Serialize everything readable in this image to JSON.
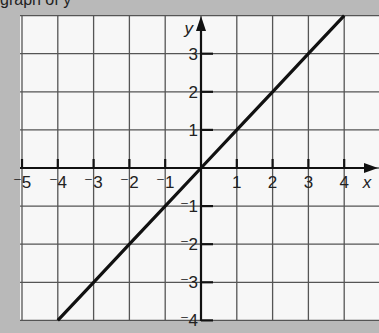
{
  "caption": "graph of y",
  "colors": {
    "page_background": "#b9b9b9",
    "grid_background": "#f7f7f7",
    "grid_line": "#555555",
    "axis": "#111111",
    "plot_line": "#111111"
  },
  "axes": {
    "x_label": "x",
    "y_label": "y",
    "x_ticks": [
      {
        "value": -5,
        "label": "⁻5"
      },
      {
        "value": -4,
        "label": "⁻4"
      },
      {
        "value": -3,
        "label": "⁻3"
      },
      {
        "value": -2,
        "label": "⁻2"
      },
      {
        "value": -1,
        "label": "⁻1"
      },
      {
        "value": 1,
        "label": "1"
      },
      {
        "value": 2,
        "label": "2"
      },
      {
        "value": 3,
        "label": "3"
      },
      {
        "value": 4,
        "label": "4"
      }
    ],
    "y_ticks": [
      {
        "value": 3,
        "label": "3"
      },
      {
        "value": 2,
        "label": "2"
      },
      {
        "value": 1,
        "label": "1"
      },
      {
        "value": -1,
        "label": "⁻1"
      },
      {
        "value": -2,
        "label": "⁻2"
      },
      {
        "value": -3,
        "label": "⁻3"
      },
      {
        "value": -4,
        "label": "⁻4"
      }
    ]
  },
  "chart_data": {
    "type": "line",
    "title": "",
    "xlabel": "x",
    "ylabel": "y",
    "xlim": [
      -5,
      5
    ],
    "ylim": [
      -4,
      4
    ],
    "grid": true,
    "series": [
      {
        "name": "y = x",
        "x": [
          -4,
          -3,
          -2,
          -1,
          0,
          1,
          2,
          3,
          4
        ],
        "y": [
          -4,
          -3,
          -2,
          -1,
          0,
          1,
          2,
          3,
          4
        ]
      }
    ]
  }
}
